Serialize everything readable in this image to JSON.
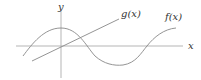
{
  "diagram": {
    "type": "function-graph",
    "axes": {
      "x_label": "x",
      "y_label": "y",
      "color": "#b0b0b0"
    },
    "curves": [
      {
        "name": "f(x)",
        "label": "f(x)",
        "shape": "cosine-like wave",
        "color": "#777777"
      },
      {
        "name": "g(x)",
        "label": "g(x)",
        "shape": "straight line through origin",
        "color": "#777777"
      }
    ]
  }
}
